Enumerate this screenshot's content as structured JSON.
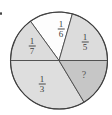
{
  "page": {
    "list_marker": "."
  },
  "chart_data": {
    "type": "pie",
    "title": "",
    "slices": [
      {
        "name": "one-sixth",
        "label": "1/6",
        "numerator": "1",
        "denominator": "6",
        "value": 0.167,
        "shaded": false,
        "start_deg": 74,
        "end_deg": 126,
        "fill": "#fdfdfd",
        "label_x": 61,
        "label_y": 29
      },
      {
        "name": "one-fifth",
        "label": "1/5",
        "numerator": "1",
        "denominator": "5",
        "value": 0.2,
        "shaded": true,
        "start_deg": 0,
        "end_deg": 74,
        "fill": "#dcdcdc",
        "label_x": 85,
        "label_y": 42
      },
      {
        "name": "one-seventh",
        "label": "1/7",
        "numerator": "1",
        "denominator": "7",
        "value": 0.143,
        "shaded": true,
        "start_deg": 126,
        "end_deg": 180,
        "fill": "#dcdcdc",
        "label_x": 32,
        "label_y": 46
      },
      {
        "name": "one-third",
        "label": "1/3",
        "numerator": "1",
        "denominator": "3",
        "value": 0.333,
        "shaded": true,
        "start_deg": 180,
        "end_deg": 301,
        "fill": "#dedede",
        "label_x": 42,
        "label_y": 84
      },
      {
        "name": "unknown",
        "label": "?",
        "value": null,
        "shaded": true,
        "start_deg": 301,
        "end_deg": 360,
        "fill": "#c6c6c6",
        "label_x": 84,
        "label_y": 74
      }
    ],
    "geometry": {
      "cx": 59,
      "cy": 60.5,
      "r": 48.5,
      "stroke": "#4a4a4a",
      "outline_stroke": "#3f3f3f"
    }
  }
}
